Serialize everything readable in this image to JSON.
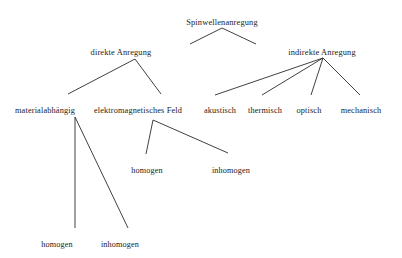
{
  "diagram": {
    "type": "tree",
    "title_node": "Spinwellenanregung",
    "language": "de",
    "background_color": "#ffffff",
    "line_color": "#2b2b2b",
    "text_color": "#1a1a1a",
    "nodes": [
      {
        "id": "root",
        "label": "Spinwellenanregung",
        "x": 222,
        "y": 18,
        "level": 0
      },
      {
        "id": "direkt",
        "label": "direkte Anregung",
        "x": 121,
        "y": 48,
        "level": 1
      },
      {
        "id": "indirekt",
        "label": "indirekte Anregung",
        "x": 322,
        "y": 48,
        "level": 1
      },
      {
        "id": "material",
        "label": "materialabhängig",
        "x": 45,
        "y": 106,
        "level": 2
      },
      {
        "id": "emfeld",
        "label": "elektromagnetisches Feld",
        "x": 138,
        "y": 106,
        "level": 2
      },
      {
        "id": "akust",
        "label": "akustisch",
        "x": 220,
        "y": 106,
        "level": 2
      },
      {
        "id": "therm",
        "label": "thermisch",
        "x": 265,
        "y": 106,
        "level": 2
      },
      {
        "id": "opt",
        "label": "optisch",
        "x": 309,
        "y": 106,
        "level": 2
      },
      {
        "id": "mech",
        "label": "mechanisch",
        "x": 361,
        "y": 106,
        "level": 2
      },
      {
        "id": "em_hom",
        "label": "homogen",
        "x": 147,
        "y": 166,
        "level": 3
      },
      {
        "id": "em_inhom",
        "label": "inhomogen",
        "x": 231,
        "y": 166,
        "level": 3
      },
      {
        "id": "mat_hom",
        "label": "homogen",
        "x": 57,
        "y": 240,
        "level": 3
      },
      {
        "id": "mat_inhom",
        "label": "inhomogen",
        "x": 120,
        "y": 240,
        "level": 3
      }
    ],
    "edges": [
      {
        "from": "root",
        "to": "direkt",
        "x1": 222,
        "y1": 28,
        "x2": 190,
        "y2": 44
      },
      {
        "from": "root",
        "to": "indirekt",
        "x1": 222,
        "y1": 28,
        "x2": 256,
        "y2": 44
      },
      {
        "from": "direkt",
        "to": "material",
        "x1": 135,
        "y1": 59,
        "x2": 68,
        "y2": 94
      },
      {
        "from": "direkt",
        "to": "emfeld",
        "x1": 135,
        "y1": 59,
        "x2": 161,
        "y2": 94
      },
      {
        "from": "indirekt",
        "to": "akust",
        "x1": 323,
        "y1": 58,
        "x2": 215,
        "y2": 95
      },
      {
        "from": "indirekt",
        "to": "therm",
        "x1": 323,
        "y1": 58,
        "x2": 262,
        "y2": 95
      },
      {
        "from": "indirekt",
        "to": "opt",
        "x1": 323,
        "y1": 58,
        "x2": 311,
        "y2": 95
      },
      {
        "from": "indirekt",
        "to": "mech",
        "x1": 323,
        "y1": 58,
        "x2": 360,
        "y2": 95
      },
      {
        "from": "emfeld",
        "to": "em_hom",
        "x1": 153,
        "y1": 120,
        "x2": 146,
        "y2": 154
      },
      {
        "from": "emfeld",
        "to": "em_inhom",
        "x1": 153,
        "y1": 120,
        "x2": 228,
        "y2": 153
      },
      {
        "from": "material",
        "to": "mat_hom",
        "x1": 75,
        "y1": 117,
        "x2": 75,
        "y2": 228
      },
      {
        "from": "material",
        "to": "mat_inhom",
        "x1": 75,
        "y1": 117,
        "x2": 128,
        "y2": 228
      }
    ]
  }
}
